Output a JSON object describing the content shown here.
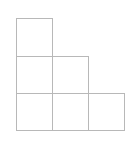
{
  "diagram": {
    "type": "staircase-grid",
    "line_color": "#b8b8b8",
    "cell_size": 37,
    "origin": {
      "x": 16,
      "y": 18
    },
    "columns": [
      3,
      2,
      1
    ],
    "rows": 3,
    "cells": [
      {
        "col": 0,
        "row": 0
      },
      {
        "col": 0,
        "row": 1
      },
      {
        "col": 1,
        "row": 1
      },
      {
        "col": 0,
        "row": 2
      },
      {
        "col": 1,
        "row": 2
      },
      {
        "col": 2,
        "row": 2
      }
    ]
  }
}
